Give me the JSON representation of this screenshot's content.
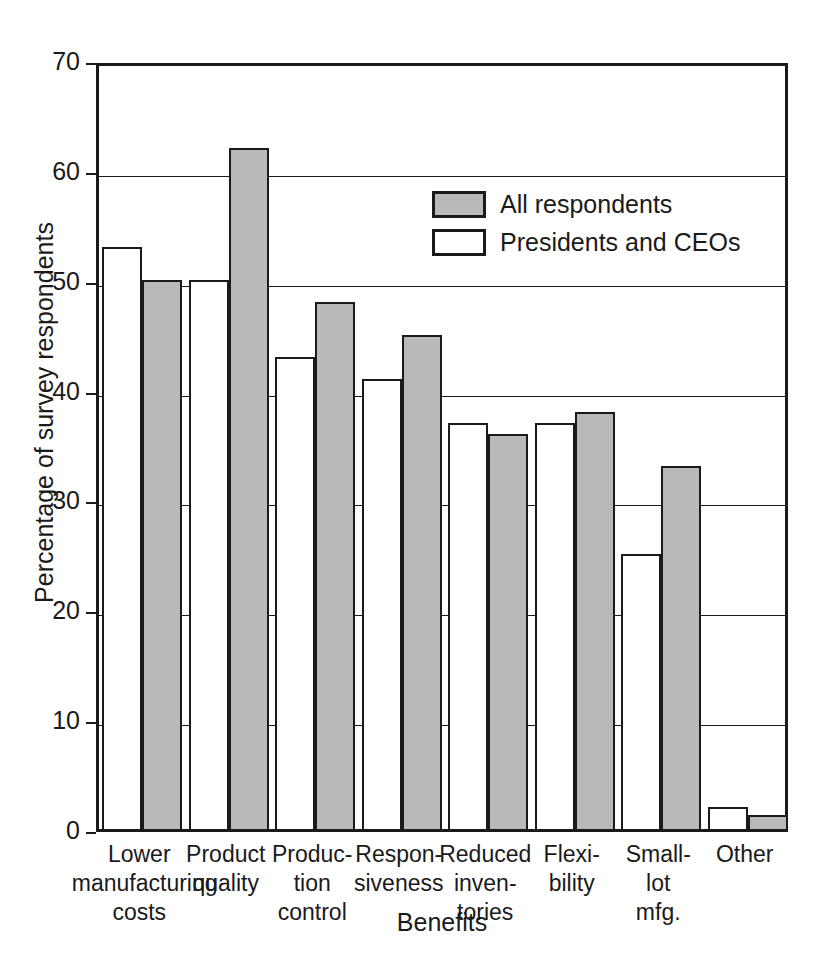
{
  "chart_data": {
    "type": "bar",
    "title": "",
    "xlabel": "Benefits",
    "ylabel": "Percentage of survey respondents",
    "ylim": [
      0,
      70
    ],
    "ytick_values": [
      0,
      10,
      20,
      30,
      40,
      50,
      60,
      70
    ],
    "ytick_labels": [
      "0",
      "10",
      "20",
      "30",
      "40",
      "50",
      "60",
      "70"
    ],
    "grid": true,
    "legend_position": "upper center",
    "categories": [
      "Lower manufacturing costs",
      "Product quality",
      "Production control",
      "Responsiveness",
      "Reduced inventories",
      "Flexibility",
      "Small-lot mfg.",
      "Other"
    ],
    "category_label_lines": [
      [
        "Lower",
        "manufacturing",
        "costs"
      ],
      [
        "Product",
        "quality"
      ],
      [
        "Produc-",
        "tion",
        "control"
      ],
      [
        "Respon-",
        "siveness"
      ],
      [
        "Reduced",
        "inven-",
        "tories"
      ],
      [
        "Flexi-",
        "bility"
      ],
      [
        "Small-",
        "lot",
        "mfg."
      ],
      [
        "Other"
      ]
    ],
    "series": [
      {
        "name": "Presidents and CEOs",
        "color": "#ffffff",
        "values": [
          53,
          50,
          43,
          41,
          37,
          37,
          25,
          2
        ]
      },
      {
        "name": "All respondents",
        "color": "#b9b9b9",
        "values": [
          50,
          62,
          48,
          45,
          36,
          38,
          33,
          1.3
        ]
      }
    ],
    "legend": [
      {
        "label": "All respondents",
        "swatch": "gray"
      },
      {
        "label": "Presidents and CEOs",
        "swatch": "white"
      }
    ]
  }
}
